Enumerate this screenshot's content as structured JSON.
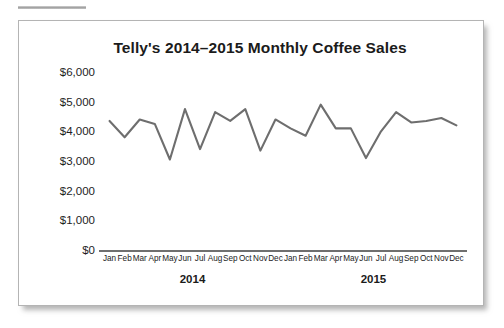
{
  "figure": {
    "title": "Telly's 2014–2015 Monthly Coffee Sales",
    "line_color": "#6e6e6e",
    "axis_color": "#6f6f6f",
    "text_color": "#1d1d1d",
    "card_background": "#ffffff"
  },
  "chart_data": {
    "type": "line",
    "title": "Telly's 2014–2015 Monthly Coffee Sales",
    "xlabel": "",
    "ylabel": "",
    "ylim": [
      0,
      6000
    ],
    "ytick_values": [
      0,
      1000,
      2000,
      3000,
      4000,
      5000,
      6000
    ],
    "ytick_labels": [
      "$0",
      "$1,000",
      "$2,000",
      "$3,000",
      "$4,000",
      "$5,000",
      "$6,000"
    ],
    "grid": false,
    "legend": false,
    "categories": [
      "Jan",
      "Feb",
      "Mar",
      "Apr",
      "May",
      "Jun",
      "Jul",
      "Aug",
      "Sep",
      "Oct",
      "Nov",
      "Dec",
      "Jan",
      "Feb",
      "Mar",
      "Apr",
      "May",
      "Jun",
      "Jul",
      "Aug",
      "Sep",
      "Oct",
      "Nov",
      "Dec"
    ],
    "group_labels": [
      "2014",
      "2015"
    ],
    "values": [
      4350,
      3800,
      4400,
      4250,
      3050,
      4750,
      3400,
      4650,
      4350,
      4750,
      3350,
      4400,
      4100,
      3850,
      4900,
      4100,
      4100,
      3100,
      4000,
      4650,
      4300,
      4350,
      4450,
      4200
    ],
    "series": [
      {
        "name": "Monthly Coffee Sales",
        "values": [
          4350,
          3800,
          4400,
          4250,
          3050,
          4750,
          3400,
          4650,
          4350,
          4750,
          3350,
          4400,
          4100,
          3850,
          4900,
          4100,
          4100,
          3100,
          4000,
          4650,
          4300,
          4350,
          4450,
          4200
        ]
      }
    ]
  }
}
